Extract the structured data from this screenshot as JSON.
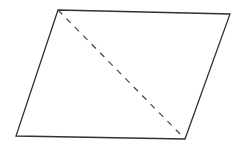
{
  "diagram": {
    "type": "parallelogram-with-diagonal",
    "background": "#ffffff",
    "stroke_color": "#333333",
    "vertices": {
      "top_left": [
        58,
        10
      ],
      "top_right": [
        230,
        14
      ],
      "bottom_right": [
        185,
        139
      ],
      "bottom_left": [
        16,
        136
      ]
    },
    "diagonal": {
      "from": "top_left",
      "to": "bottom_right",
      "style": "dashed"
    },
    "labels": []
  }
}
